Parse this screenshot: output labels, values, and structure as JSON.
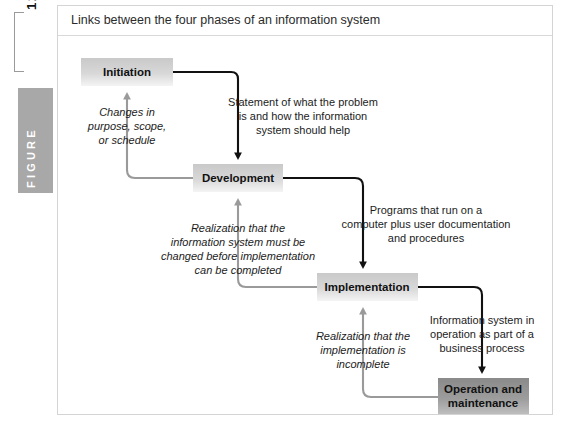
{
  "figure": {
    "number": "12.1",
    "word": "FIGURE",
    "title": "Links between the four phases of an information system"
  },
  "colors": {
    "node_light_from": "#cfcfcf",
    "node_light_to": "#f2f2f2",
    "node_dark_from": "#8f8f8f",
    "node_dark_to": "#b3b3b3",
    "forward_arrow": "#111111",
    "feedback_arrow": "#9a9a9a",
    "rail_box": "#a8a8a8",
    "frame_border": "#d4d4d4"
  },
  "diagram": {
    "type": "cycle-flowchart",
    "nodes": [
      {
        "id": "initiation",
        "label": "Initiation",
        "shade": "light",
        "x": 23,
        "y": 22,
        "w": 92,
        "h": 28
      },
      {
        "id": "development",
        "label": "Development",
        "shade": "light",
        "x": 135,
        "y": 128,
        "w": 90,
        "h": 28
      },
      {
        "id": "implementation",
        "label": "Implementation",
        "shade": "light",
        "x": 259,
        "y": 237,
        "w": 101,
        "h": 28
      },
      {
        "id": "operation",
        "label": "Operation and maintenance",
        "shade": "dark",
        "x": 380,
        "y": 342,
        "w": 91,
        "h": 38
      }
    ],
    "forward_flows": [
      {
        "from": "initiation",
        "to": "development",
        "label": "Statement of what the problem is and how the information system should help",
        "lines": [
          "Statement of what the problem",
          "is and how the information",
          "system should help"
        ],
        "label_x": 180,
        "label_y": 66
      },
      {
        "from": "development",
        "to": "implementation",
        "label": "Programs that run on a computer plus user documentation and procedures",
        "lines": [
          "Programs that run on a",
          "computer plus user documentation",
          "and procedures"
        ],
        "label_x": 305,
        "label_y": 172
      },
      {
        "from": "implementation",
        "to": "operation",
        "label": "Information system in operation as part of a business process",
        "lines": [
          "Information system in",
          "operation as part of a",
          "business process"
        ],
        "label_x": 424,
        "label_y": 281
      }
    ],
    "feedback_flows": [
      {
        "from": "development",
        "to": "initiation",
        "label": "Changes in purpose, scope, or schedule",
        "lines": [
          "Changes in",
          "purpose, scope,",
          "or schedule"
        ],
        "label_x": 68,
        "label_y": 82
      },
      {
        "from": "implementation",
        "to": "development",
        "label": "Realization that the information system must be changed before implementation can be completed",
        "lines": [
          "Realization that the",
          "information system must be",
          "changed before implementation",
          "can be completed"
        ],
        "label_x": 180,
        "label_y": 194
      },
      {
        "from": "operation",
        "to": "implementation",
        "label": "Realization that the implementation is incomplete",
        "lines": [
          "Realization that the",
          "implementation is",
          "incomplete"
        ],
        "label_x": 305,
        "label_y": 298
      }
    ]
  }
}
